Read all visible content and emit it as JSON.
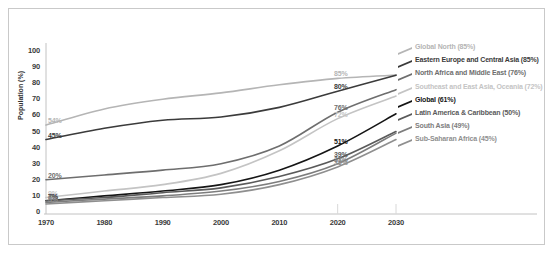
{
  "chart_data": {
    "type": "line",
    "title": "",
    "xlabel": "",
    "ylabel": "Population (%)",
    "xlim": [
      1970,
      2030
    ],
    "ylim": [
      0,
      100
    ],
    "grid": false,
    "legend_position": "right",
    "x_ticks": [
      "1970",
      "1980",
      "1990",
      "2000",
      "2010",
      "2020",
      "2030"
    ],
    "y_ticks": [
      "0",
      "10",
      "20",
      "30",
      "40",
      "50",
      "60",
      "70",
      "80",
      "90",
      "100"
    ],
    "x": [
      1970,
      1980,
      1990,
      2000,
      2010,
      2020,
      2030
    ],
    "series": [
      {
        "name": "Global North",
        "legend_label": "Global North (85%)",
        "color": "#b5b5b5",
        "start_label": "54%",
        "end_label": "85%",
        "values": [
          54,
          64,
          70,
          74,
          79,
          83,
          85
        ]
      },
      {
        "name": "Eastern Europe and Central Asia",
        "legend_label": "Eastern Europe and Central Asia (85%)",
        "color": "#3b3b3b",
        "start_label": "45%",
        "end_label": "80%",
        "values": [
          45,
          52,
          57,
          59,
          65,
          75,
          85
        ]
      },
      {
        "name": "North Africa and Middle East",
        "legend_label": "North Africa and Middle East (76%)",
        "color": "#6e6e6e",
        "start_label": "20%",
        "end_label": "76%",
        "values": [
          20,
          23,
          26,
          30,
          41,
          62,
          76
        ]
      },
      {
        "name": "Southeast and East Asia, Oceania",
        "legend_label": "Southeast and East Asia, Oceania (72%)",
        "color": "#c4c4c4",
        "start_label": "9%",
        "end_label": "72%",
        "values": [
          9,
          13,
          17,
          24,
          38,
          58,
          72
        ]
      },
      {
        "name": "Global",
        "legend_label": "Global (61%)",
        "color": "#151515",
        "start_label": "7%",
        "end_label": "51%",
        "values": [
          7,
          10,
          13,
          17,
          26,
          41,
          61
        ]
      },
      {
        "name": "Latin America & Caribbean",
        "legend_label": "Latin America & Caribbean (50%)",
        "color": "#5a5a5a",
        "start_label": "7%",
        "end_label": "39%",
        "values": [
          7,
          9,
          12,
          15,
          22,
          33,
          50
        ]
      },
      {
        "name": "South Asia",
        "legend_label": "South Asia (49%)",
        "color": "#7d7d7d",
        "start_label": "6%",
        "end_label": "33%",
        "values": [
          6,
          8,
          10,
          13,
          19,
          30,
          49
        ]
      },
      {
        "name": "Sub-Saharan Africa",
        "legend_label": "Sub-Saharan Africa (45%)",
        "color": "#8f8f8f",
        "start_label": "5%",
        "end_label": "33%",
        "values": [
          5,
          7,
          9,
          11,
          17,
          28,
          45
        ]
      }
    ]
  }
}
